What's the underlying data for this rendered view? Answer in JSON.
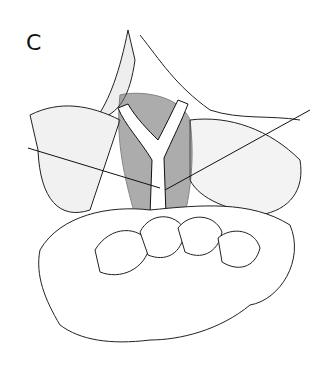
{
  "figure": {
    "panel_label": "C",
    "type": "pen-and-ink surgical illustration",
    "elements": [
      "branching-vessel",
      "retracted-tissue",
      "two-suture-needles",
      "fingers-retracting"
    ]
  }
}
